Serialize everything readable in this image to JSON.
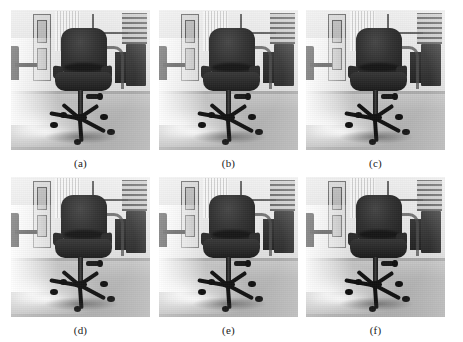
{
  "figure": {
    "type": "image-grid",
    "rows": 2,
    "columns": 3,
    "background_color": "#ffffff",
    "caption_color": "#1a1a1a",
    "panels": [
      {
        "id": "a",
        "caption": "(a)",
        "subject": "office-chair",
        "description": "Grayscale photograph of a dark swivel office chair on a tiled floor with a doorway, window blinds and dark shelving in the background",
        "row": 1,
        "column": 1
      },
      {
        "id": "b",
        "caption": "(b)",
        "subject": "office-chair",
        "description": "Grayscale photograph of a dark swivel office chair on a tiled floor with a doorway, window blinds and dark shelving in the background",
        "row": 1,
        "column": 2
      },
      {
        "id": "c",
        "caption": "(c)",
        "subject": "office-chair",
        "description": "Grayscale photograph of a dark swivel office chair on a tiled floor with a doorway, window blinds and dark shelving in the background",
        "row": 1,
        "column": 3
      },
      {
        "id": "d",
        "caption": "(d)",
        "subject": "office-chair",
        "description": "Grayscale photograph of a dark swivel office chair on a tiled floor with a doorway, window blinds and dark shelving in the background",
        "row": 2,
        "column": 1
      },
      {
        "id": "e",
        "caption": "(e)",
        "subject": "office-chair",
        "description": "Grayscale photograph of a dark swivel office chair on a tiled floor with a doorway, window blinds and dark shelving in the background",
        "row": 2,
        "column": 2
      },
      {
        "id": "f",
        "caption": "(f)",
        "subject": "office-chair",
        "description": "Grayscale photograph of a dark swivel office chair on a tiled floor with a doorway, window blinds and dark shelving in the background",
        "row": 2,
        "column": 3
      }
    ]
  }
}
